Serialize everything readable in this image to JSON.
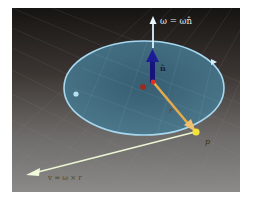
{
  "diagram": {
    "labels": {
      "omega": "ω = ωn̂",
      "n_hat": "n̂",
      "r": "r",
      "p": "p",
      "velocity": "v = ω × r",
      "origin": "o"
    },
    "colors": {
      "background_top": "#1a1816",
      "background_bottom": "#8a8886",
      "disk_fill": "#3e6f85",
      "disk_edge": "#9ed3ee",
      "omega_arrow": "#dff1ff",
      "n_hat_arrow": "#1a1a8a",
      "r_arrow": "#e0a84a",
      "velocity_arrow": "#eef7d8",
      "point_p": "#f2e23a",
      "origin_marker": "#c0301f"
    }
  }
}
